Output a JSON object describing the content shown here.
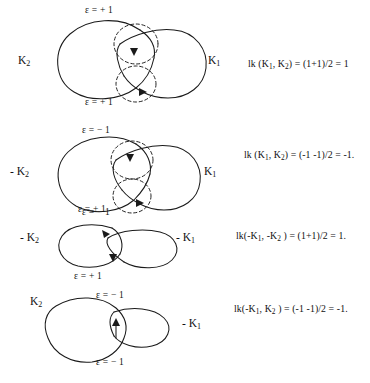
{
  "figure": {
    "type": "knot-theory-linking-number-diagram",
    "rows": [
      {
        "id": "row-1",
        "left_knot_label": "K",
        "left_knot_sub": "2",
        "right_knot_label": "K",
        "right_knot_sub": "1",
        "crossing_top_sign": "ε = + 1",
        "crossing_bottom_sign": "ε = + 1",
        "formula": "lk (K",
        "formula_sub1": "1",
        "formula_mid": ", K",
        "formula_sub2": "2",
        "formula_tail": ") = (1+1)/2 = 1",
        "linking_number": 1
      },
      {
        "id": "row-2",
        "left_knot_label": "- K",
        "left_knot_sub": "2",
        "right_knot_label": "K",
        "right_knot_sub": "1",
        "crossing_top_sign": "ε = − 1",
        "crossing_bottom_sign": "ε = − 1",
        "formula": "lk (K",
        "formula_sub1": "1",
        "formula_mid": ", K",
        "formula_sub2": "2",
        "formula_tail": ") = (-1 -1)/2 = -1.",
        "linking_number": -1
      },
      {
        "id": "row-3",
        "left_knot_label": "- K",
        "left_knot_sub": "2",
        "right_knot_label": "- K",
        "right_knot_sub": "1",
        "crossing_top_sign": "ε = + 1",
        "crossing_bottom_sign": "ε = + 1",
        "formula": "lk(-K",
        "formula_sub1": "1",
        "formula_mid": ", -K",
        "formula_sub2": "2",
        "formula_tail": " ) = (1+1)/2 = 1.",
        "linking_number": 1
      },
      {
        "id": "row-4",
        "left_knot_label": "K",
        "left_knot_sub": "2",
        "right_knot_label": "- K",
        "right_knot_sub": "1",
        "crossing_top_sign": "ε = − 1",
        "crossing_bottom_sign": "ε = − 1",
        "formula": "lk(-K",
        "formula_sub1": "1",
        "formula_mid": ", K",
        "formula_sub2": "2",
        "formula_tail": " ) = (-1 -1)/2 = -1.",
        "linking_number": -1
      }
    ],
    "bottom_caption": ""
  }
}
